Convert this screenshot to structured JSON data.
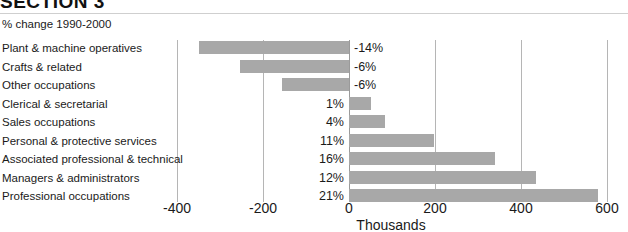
{
  "header": {
    "section_title": "SECTION 3"
  },
  "subtitle": "% change 1990-2000",
  "axis": {
    "title": "Thousands",
    "ticks": [
      "-400",
      "-200",
      "0",
      "200",
      "400",
      "600"
    ]
  },
  "colors": {
    "bar": "#a8a8a8",
    "gridline": "#b5b5b5",
    "text": "#1a1a1a"
  },
  "chart_data": {
    "type": "bar",
    "orientation": "horizontal",
    "title": "SECTION 3",
    "subtitle": "% change 1990-2000",
    "xlabel": "Thousands",
    "ylabel": "",
    "xlim": [
      -460,
      640
    ],
    "xticks": [
      -400,
      -200,
      0,
      200,
      400,
      600
    ],
    "grid": true,
    "legend": false,
    "categories": [
      "Plant & machine operatives",
      "Crafts & related",
      "Other occupations",
      "Clerical & secretarial",
      "Sales occupations",
      "Personal & protective services",
      "Associated professional & technical",
      "Managers & administrators",
      "Professional occupations"
    ],
    "values": [
      -350,
      -253,
      -156,
      51,
      84,
      197,
      340,
      435,
      578
    ],
    "data_labels": [
      "-14%",
      "-6%",
      "-6%",
      "1%",
      "4%",
      "11%",
      "16%",
      "12%",
      "21%"
    ]
  }
}
